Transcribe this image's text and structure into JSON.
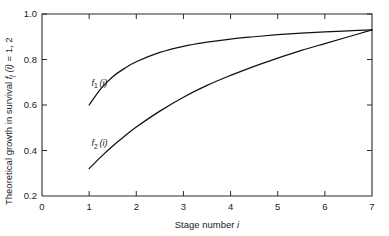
{
  "chart_data": {
    "type": "line",
    "title": "",
    "xlabel": "Stage number i",
    "ylabel": "Theoretical growth in survival fj (i) = 1, 2",
    "xlim": [
      0,
      7
    ],
    "ylim": [
      0.2,
      1.0
    ],
    "grid": false,
    "legend": "inline-curve-labels",
    "x_ticks": [
      "0",
      "1",
      "2",
      "3",
      "4",
      "5",
      "6",
      "7"
    ],
    "x_tick_values": [
      0,
      1,
      2,
      3,
      4,
      5,
      6,
      7
    ],
    "y_ticks": [
      "0.2",
      "0.4",
      "0.6",
      "0.8",
      "1.0"
    ],
    "y_tick_values": [
      0.2,
      0.4,
      0.6,
      0.8,
      1.0
    ],
    "series": [
      {
        "name": "f1 (i)",
        "label_text": "f",
        "label_sub": "1",
        "label_arg": "(i)",
        "x": [
          1,
          1.25,
          1.5,
          1.75,
          2,
          2.5,
          3,
          3.5,
          4,
          4.5,
          5,
          5.5,
          6,
          6.5,
          7
        ],
        "values": [
          0.6,
          0.672,
          0.724,
          0.761,
          0.79,
          0.831,
          0.858,
          0.876,
          0.89,
          0.9,
          0.909,
          0.916,
          0.921,
          0.926,
          0.93
        ]
      },
      {
        "name": "f2 (i)",
        "label_text": "f",
        "label_sub": "2",
        "label_arg": "(i)",
        "x": [
          1,
          1.25,
          1.5,
          1.75,
          2,
          2.5,
          3,
          3.5,
          4,
          4.5,
          5,
          5.5,
          6,
          6.5,
          7
        ],
        "values": [
          0.32,
          0.372,
          0.42,
          0.463,
          0.503,
          0.573,
          0.634,
          0.686,
          0.73,
          0.77,
          0.806,
          0.84,
          0.87,
          0.9,
          0.93
        ]
      }
    ],
    "annotations": [
      {
        "name": "f1-curve-label",
        "text": "f1 (i)",
        "x": 1.05,
        "y": 0.685
      },
      {
        "name": "f2-curve-label",
        "text": "f2 (i)",
        "x": 1.05,
        "y": 0.418
      }
    ]
  },
  "axes": {
    "y_title_prefix": "Theoretical growth in survival ",
    "y_title_f": "f",
    "y_title_sub": "j",
    "y_title_arg": " (i)",
    "y_title_suffix": " = 1, 2",
    "x_title_prefix": "Stage number ",
    "x_title_var": "i"
  },
  "ticks": {
    "y": [
      {
        "label": "1.0",
        "value": 1.0
      },
      {
        "label": "0.8",
        "value": 0.8
      },
      {
        "label": "0.6",
        "value": 0.6
      },
      {
        "label": "0.4",
        "value": 0.4
      },
      {
        "label": "0.2",
        "value": 0.2
      }
    ],
    "x": [
      {
        "label": "0",
        "value": 0
      },
      {
        "label": "1",
        "value": 1
      },
      {
        "label": "2",
        "value": 2
      },
      {
        "label": "3",
        "value": 3
      },
      {
        "label": "4",
        "value": 4
      },
      {
        "label": "5",
        "value": 5
      },
      {
        "label": "6",
        "value": 6
      },
      {
        "label": "7",
        "value": 7
      }
    ]
  },
  "style": {
    "axis_color": "#2b2b2b",
    "curve_color": "#111111",
    "background": "#ffffff"
  }
}
